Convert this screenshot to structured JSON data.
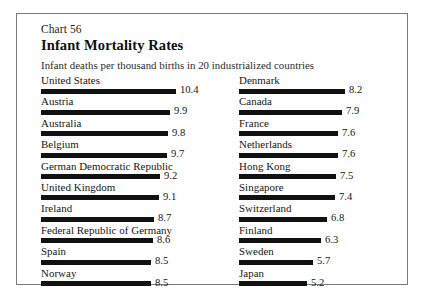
{
  "chart": {
    "number_label": "Chart 56",
    "title": "Infant Mortality Rates",
    "subtitle": "Infant deaths per thousand births in 20 industrialized countries"
  },
  "chart_data": {
    "type": "bar",
    "orientation": "horizontal",
    "title": "Infant Mortality Rates",
    "subtitle": "Infant deaths per thousand births in 20 industrialized countries",
    "number_label": "Chart 56",
    "xlabel": "",
    "ylabel": "",
    "xlim": [
      0,
      10.4
    ],
    "grid": false,
    "legend": false,
    "units": "deaths per thousand births",
    "bar_color": "#111111",
    "categories": [
      "United States",
      "Austria",
      "Australia",
      "Belgium",
      "German Democratic Republic",
      "United Kingdom",
      "Ireland",
      "Federal Republic of Germany",
      "Spain",
      "Norway",
      "Denmark",
      "Canada",
      "France",
      "Netherlands",
      "Hong Kong",
      "Singapore",
      "Switzerland",
      "Finland",
      "Sweden",
      "Japan"
    ],
    "values": [
      10.4,
      9.9,
      9.8,
      9.7,
      9.2,
      9.1,
      8.7,
      8.6,
      8.5,
      8.5,
      8.2,
      7.9,
      7.6,
      7.6,
      7.5,
      7.4,
      6.8,
      6.3,
      5.7,
      5.2
    ],
    "columns": {
      "left": [
        {
          "label": "United States",
          "value": 10.4,
          "value_text": "10.4"
        },
        {
          "label": "Austria",
          "value": 9.9,
          "value_text": "9.9"
        },
        {
          "label": "Australia",
          "value": 9.8,
          "value_text": "9.8"
        },
        {
          "label": "Belgium",
          "value": 9.7,
          "value_text": "9.7"
        },
        {
          "label": "German Democratic Republic",
          "value": 9.2,
          "value_text": "9.2"
        },
        {
          "label": "United Kingdom",
          "value": 9.1,
          "value_text": "9.1"
        },
        {
          "label": "Ireland",
          "value": 8.7,
          "value_text": "8.7"
        },
        {
          "label": "Federal Republic of Germany",
          "value": 8.6,
          "value_text": "8.6"
        },
        {
          "label": "Spain",
          "value": 8.5,
          "value_text": "8.5"
        },
        {
          "label": "Norway",
          "value": 8.5,
          "value_text": "8.5"
        }
      ],
      "right": [
        {
          "label": "Denmark",
          "value": 8.2,
          "value_text": "8.2"
        },
        {
          "label": "Canada",
          "value": 7.9,
          "value_text": "7.9"
        },
        {
          "label": "France",
          "value": 7.6,
          "value_text": "7.6"
        },
        {
          "label": "Netherlands",
          "value": 7.6,
          "value_text": "7.6"
        },
        {
          "label": "Hong Kong",
          "value": 7.5,
          "value_text": "7.5"
        },
        {
          "label": "Singapore",
          "value": 7.4,
          "value_text": "7.4"
        },
        {
          "label": "Switzerland",
          "value": 6.8,
          "value_text": "6.8"
        },
        {
          "label": "Finland",
          "value": 6.3,
          "value_text": "6.3"
        },
        {
          "label": "Sweden",
          "value": 5.7,
          "value_text": "5.7"
        },
        {
          "label": "Japan",
          "value": 5.2,
          "value_text": "5.2"
        }
      ]
    }
  },
  "render": {
    "bar_max_px": 135,
    "value_scale_max": 10.4,
    "value_gap_px": 4
  }
}
